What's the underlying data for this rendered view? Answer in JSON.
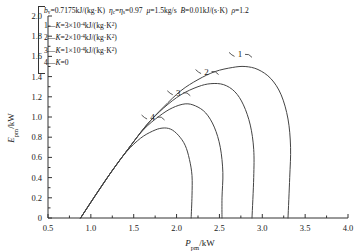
{
  "chart_data": {
    "type": "line",
    "title": "",
    "xlabel": "P_pm/kW",
    "ylabel": "E_pm/kW",
    "xlim": [
      0.5,
      4.0
    ],
    "ylim": [
      0.0,
      2.0
    ],
    "xticks": [
      "0.5",
      "1.0",
      "1.5",
      "2.0",
      "2.5",
      "3.0",
      "3.5",
      "4.0"
    ],
    "yticks": [
      "0",
      "0.2",
      "0.4",
      "0.6",
      "0.8",
      "1.0",
      "1.2",
      "1.4",
      "1.6",
      "1.8",
      "2.0"
    ],
    "grid": false,
    "legend_position": "upper-left",
    "series": [
      {
        "name": "1",
        "label": "1—K=3×10⁻⁴kJ/(kg·K²)",
        "K": "3e-4",
        "points": [
          [
            0.88,
            0.0
          ],
          [
            1.05,
            0.22
          ],
          [
            1.25,
            0.47
          ],
          [
            1.45,
            0.7
          ],
          [
            1.65,
            0.92
          ],
          [
            1.85,
            1.1
          ],
          [
            2.05,
            1.26
          ],
          [
            2.25,
            1.37
          ],
          [
            2.45,
            1.45
          ],
          [
            2.65,
            1.49
          ],
          [
            2.8,
            1.5
          ],
          [
            2.95,
            1.47
          ],
          [
            3.1,
            1.38
          ],
          [
            3.22,
            1.22
          ],
          [
            3.3,
            0.98
          ],
          [
            3.33,
            0.7
          ],
          [
            3.32,
            0.4
          ],
          [
            3.3,
            0.0
          ]
        ]
      },
      {
        "name": "2",
        "label": "2—K=2×10⁻⁴kJ/(kg·K²)",
        "K": "2e-4",
        "points": [
          [
            0.88,
            0.0
          ],
          [
            1.05,
            0.22
          ],
          [
            1.25,
            0.47
          ],
          [
            1.45,
            0.7
          ],
          [
            1.65,
            0.92
          ],
          [
            1.85,
            1.09
          ],
          [
            2.05,
            1.22
          ],
          [
            2.25,
            1.3
          ],
          [
            2.4,
            1.33
          ],
          [
            2.55,
            1.32
          ],
          [
            2.68,
            1.25
          ],
          [
            2.78,
            1.12
          ],
          [
            2.86,
            0.92
          ],
          [
            2.9,
            0.68
          ],
          [
            2.9,
            0.4
          ],
          [
            2.88,
            0.0
          ]
        ]
      },
      {
        "name": "3",
        "label": "3—K=1×10⁻⁴kJ/(kg·K²)",
        "K": "1e-4",
        "points": [
          [
            0.88,
            0.0
          ],
          [
            1.05,
            0.22
          ],
          [
            1.25,
            0.47
          ],
          [
            1.45,
            0.7
          ],
          [
            1.62,
            0.88
          ],
          [
            1.8,
            1.01
          ],
          [
            1.95,
            1.09
          ],
          [
            2.1,
            1.13
          ],
          [
            2.22,
            1.11
          ],
          [
            2.34,
            1.04
          ],
          [
            2.44,
            0.9
          ],
          [
            2.51,
            0.7
          ],
          [
            2.54,
            0.45
          ],
          [
            2.53,
            0.2
          ],
          [
            2.53,
            0.0
          ]
        ]
      },
      {
        "name": "4",
        "label": "4—K=0",
        "K": "0",
        "points": [
          [
            0.88,
            0.0
          ],
          [
            1.05,
            0.22
          ],
          [
            1.25,
            0.47
          ],
          [
            1.42,
            0.66
          ],
          [
            1.58,
            0.79
          ],
          [
            1.72,
            0.86
          ],
          [
            1.83,
            0.89
          ],
          [
            1.93,
            0.88
          ],
          [
            2.02,
            0.82
          ],
          [
            2.1,
            0.72
          ],
          [
            2.15,
            0.58
          ],
          [
            2.18,
            0.42
          ],
          [
            2.18,
            0.22
          ],
          [
            2.17,
            0.0
          ]
        ]
      }
    ],
    "annotations": [
      {
        "text": "1",
        "x": 2.74,
        "y": 1.62
      },
      {
        "text": "2",
        "x": 2.35,
        "y": 1.45
      },
      {
        "text": "3",
        "x": 2.02,
        "y": 1.24
      },
      {
        "text": "4",
        "x": 1.72,
        "y": 1.0
      }
    ]
  },
  "legend": {
    "header": {
      "bv_sym": "b",
      "bv_sub": "v",
      "bv_val": "=0.7175kJ/(kg·K)",
      "eta_c": "η",
      "eta_c_sub": "c",
      "eta_eq": "=",
      "eta_s": "η",
      "eta_s_sub": "s",
      "eta_val": "=0.97",
      "mu_sym": "μ",
      "mu_val": "=1.5kg/s",
      "B_sym": "B",
      "B_val": "=0.01kJ/(s·K)",
      "rho_sym": "ρ",
      "rho_val": "=1.2"
    },
    "entries": [
      {
        "index": "1",
        "dash": "—",
        "Ksym": "K",
        "eq": "=3",
        "mult": "×10",
        "exp": "-4",
        "unit": "kJ/(kg·K",
        "unit_exp": "2",
        "unit_end": ")"
      },
      {
        "index": "2",
        "dash": "—",
        "Ksym": "K",
        "eq": "=2",
        "mult": "×10",
        "exp": "-4",
        "unit": "kJ/(kg·K",
        "unit_exp": "2",
        "unit_end": ")"
      },
      {
        "index": "3",
        "dash": "—",
        "Ksym": "K",
        "eq": "=1",
        "mult": "×10",
        "exp": "-4",
        "unit": "kJ/(kg·K",
        "unit_exp": "2",
        "unit_end": ")"
      },
      {
        "index": "4",
        "dash": "—",
        "Ksym": "K",
        "eq": "=0",
        "mult": "",
        "exp": "",
        "unit": "",
        "unit_exp": "",
        "unit_end": ""
      }
    ]
  },
  "axes": {
    "y_label_sym": "E",
    "y_label_sub": "pm",
    "y_label_unit": "/kW",
    "x_label_sym": "P",
    "x_label_sub": "pm",
    "x_label_unit": "/kW"
  }
}
